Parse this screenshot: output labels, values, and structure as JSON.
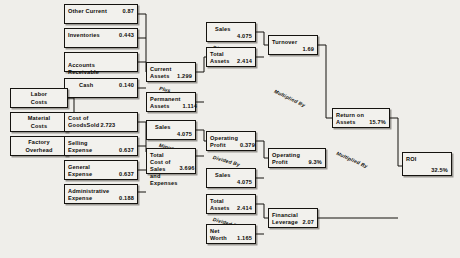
{
  "diagram": {
    "operators": {
      "plus": "Plus",
      "minus": "Minus",
      "divided_by": "Divided By",
      "multiplied_by": "Multiplied By"
    },
    "nodes": {
      "other_current": {
        "label": "Other Current",
        "value": "0.87"
      },
      "inventories": {
        "label": "Inventories",
        "value": "0.443"
      },
      "accounts_receivable": {
        "label": "Accounts\nReceivable",
        "value": ""
      },
      "cash": {
        "label": "Cash",
        "value": "0.140"
      },
      "labor_costs": {
        "label": "Labor\nCosts",
        "value": ""
      },
      "material_costs": {
        "label": "Material\nCosts",
        "value": ""
      },
      "factory_overhead": {
        "label": "Factory\nOverhead",
        "value": ""
      },
      "cost_of_goods_sold": {
        "label": "Cost of\nGoodsSold",
        "value": "2.723"
      },
      "selling_expense": {
        "label": "Selling\nExpense",
        "value": "0.637"
      },
      "general_expense": {
        "label": "General\nExpense",
        "value": "0.637"
      },
      "administrative_expense": {
        "label": "Administrative\nExpense",
        "value": "0.188"
      },
      "current_assets": {
        "label": "Current\nAssets",
        "value": "1.299"
      },
      "permanent_assets": {
        "label": "Permanent\nAssets",
        "value": "1.114"
      },
      "sales_top": {
        "label": "Sales",
        "value": "4.075"
      },
      "total_cost": {
        "label": "Total Cost of\nSales and\nExpenses",
        "value": "3.696"
      },
      "sales_turnover": {
        "label": "Sales",
        "value": "4.075"
      },
      "total_assets_turnover": {
        "label": "Total\nAssets",
        "value": "2.414"
      },
      "operating_profit_abs": {
        "label": "Operating\nProfit",
        "value": "0.379"
      },
      "sales_margin": {
        "label": "Sales",
        "value": "4.075"
      },
      "total_assets_lev": {
        "label": "Total\nAssets",
        "value": "2.414"
      },
      "net_worth": {
        "label": "Net Worth",
        "value": "1.165"
      },
      "turnover": {
        "label": "Turnover",
        "value": "1.69"
      },
      "operating_profit_pct": {
        "label": "Operating Profit",
        "value": "9.3%"
      },
      "financial_leverage": {
        "label": "Financial\nLeverage",
        "value": "2.07"
      },
      "return_on_assets": {
        "label": "Return on\nAssets",
        "value": "15.7%"
      },
      "roi": {
        "label": "ROI",
        "value": "32.5%"
      }
    }
  }
}
